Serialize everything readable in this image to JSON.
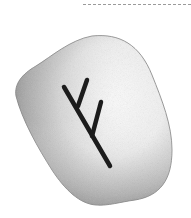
{
  "image": {
    "subject": "rune-stone",
    "rune": "ᚠ",
    "rune_name": "Fehu",
    "colors": {
      "background": "#ffffff",
      "stone_light": "#f6f6f6",
      "stone_shadow": "#8a8a8a",
      "rune_stroke": "#1c1c1c",
      "top_rule": "#9a9a9a"
    }
  }
}
